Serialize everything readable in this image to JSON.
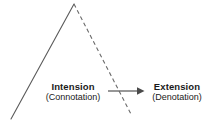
{
  "diagram": {
    "background_color": "#ffffff",
    "line_color": "#5a5a5a",
    "arrow_color": "#6a6a6a",
    "text_color": "#1a1a1a",
    "left_node": {
      "primary": "Intension",
      "secondary": "(Connotation)"
    },
    "right_node": {
      "primary": "Extension",
      "secondary": "(Denotation)"
    },
    "arrow": {
      "name": "intension-to-extension-arrow",
      "direction": "right",
      "from_x": 108,
      "to_x": 144,
      "y": 91
    },
    "apex": {
      "x": 74,
      "y": 4
    },
    "solid_leg": {
      "style": "solid",
      "from": [
        74,
        4
      ],
      "to": [
        11,
        119
      ]
    },
    "dashed_leg": {
      "style": "dashed",
      "from": [
        74,
        4
      ],
      "to": [
        132,
        116
      ],
      "dash_pattern": "4 3"
    }
  }
}
